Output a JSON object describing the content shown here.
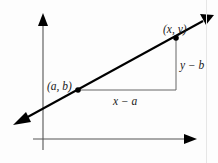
{
  "diagram": {
    "axes": {
      "x_axis": {
        "present": true,
        "arrow": "right"
      },
      "y_axis": {
        "present": true,
        "arrow": "up"
      }
    },
    "line": {
      "arrows": "both",
      "color": "#000000"
    },
    "points": [
      {
        "id": "p1",
        "label": "(a, b)"
      },
      {
        "id": "p2",
        "label": "(x, y)"
      }
    ],
    "legs": {
      "horizontal": {
        "label": "x − a"
      },
      "vertical": {
        "label": "y − b"
      }
    },
    "colors": {
      "line": "#000000",
      "axes": "#444444",
      "legs": "#555555",
      "background": "#fdfdfd"
    }
  }
}
